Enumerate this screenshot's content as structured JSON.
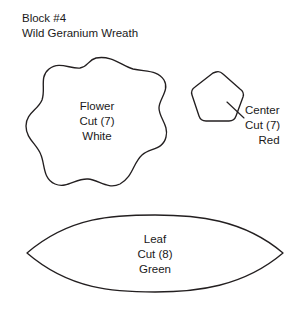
{
  "document": {
    "block_number_line": "Block #4",
    "block_name_line": "Wild Geranium Wreath",
    "background_color": "#ffffff",
    "ink_color": "#231f20"
  },
  "pieces": [
    {
      "id": "flower",
      "shape": "scalloped-blob",
      "name": "Flower",
      "cut": "Cut (7)",
      "fabric": "White",
      "has_leader_line": false
    },
    {
      "id": "center",
      "shape": "rounded-pentagon",
      "name": "Center",
      "cut": "Cut (7)",
      "fabric": "Red",
      "has_leader_line": true
    },
    {
      "id": "leaf",
      "shape": "lens",
      "name": "Leaf",
      "cut": "Cut (8)",
      "fabric": "Green",
      "has_leader_line": false
    }
  ]
}
